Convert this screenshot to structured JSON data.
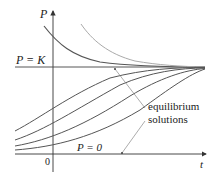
{
  "diagram": {
    "type": "logistic-solution-curves",
    "axes": {
      "y_label": "P",
      "x_label": "t",
      "origin_label": "0"
    },
    "equilibria": {
      "upper_label": "P = K",
      "lower_label": "P = 0"
    },
    "annotation": {
      "line1": "equilibrium",
      "line2": "solutions"
    },
    "colors": {
      "axis": "#333333",
      "curve_dark": "#555555",
      "curve_light": "#aaaaaa",
      "text": "#222222"
    }
  }
}
